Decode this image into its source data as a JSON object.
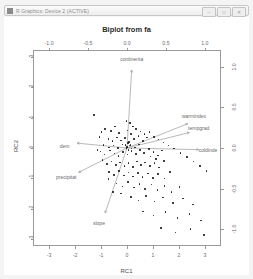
{
  "window": {
    "title": "R Graphics: Device 2 (ACTIVE)",
    "icon": "app-icon",
    "controls": [
      {
        "name": "minimize-button",
        "glyph": "–"
      },
      {
        "name": "maximize-button",
        "glyph": "□"
      },
      {
        "name": "close-button",
        "glyph": "✕"
      }
    ]
  },
  "chart_data": {
    "type": "scatter",
    "title": "Biplot from fa",
    "xlabel": "RC1",
    "ylabel": "RC2",
    "xlim": [
      -3.6,
      3.6
    ],
    "ylim": [
      -3.2,
      3.2
    ],
    "xticks": [
      "-3",
      "-2",
      "-1",
      "0",
      "1",
      "2",
      "3"
    ],
    "yticks": [
      "3",
      "2",
      "1",
      "0",
      "-1",
      "-2",
      "-3"
    ],
    "top_axis_label": "",
    "top_ticks": [
      "-1.0",
      "-0.5",
      "0.0",
      "0.5",
      "1.0"
    ],
    "right_axis_label": "",
    "right_ticks": [
      "1.0",
      "0.5",
      "0.0",
      "-0.5",
      "-1.0"
    ],
    "secondary_xlim": [
      -1.2,
      1.2
    ],
    "secondary_ylim": [
      -1.2,
      1.2
    ],
    "grid": false,
    "legend": "none",
    "loadings": [
      {
        "label": "continenta",
        "x": 0.06,
        "y": 0.96,
        "label_x": 0.06,
        "label_y": 1.1
      },
      {
        "label": "warmindex",
        "x": 0.78,
        "y": 0.3,
        "label_x": 0.86,
        "label_y": 0.4
      },
      {
        "label": "tempgrad",
        "x": 0.8,
        "y": 0.19,
        "label_x": 0.92,
        "label_y": 0.25
      },
      {
        "label": "coldinde",
        "x": 0.92,
        "y": -0.02,
        "label_x": 1.04,
        "label_y": -0.02
      },
      {
        "label": "dem",
        "x": -0.64,
        "y": 0.06,
        "label_x": -0.8,
        "label_y": 0.02
      },
      {
        "label": "precipitat",
        "x": -0.62,
        "y": -0.3,
        "label_x": -0.78,
        "label_y": -0.36
      },
      {
        "label": "slope",
        "x": -0.28,
        "y": -0.8,
        "label_x": -0.36,
        "label_y": -0.92
      }
    ],
    "points": [
      [
        -1.28,
        1.08
      ],
      [
        -0.84,
        0.62
      ],
      [
        -0.62,
        0.56
      ],
      [
        -0.46,
        0.7
      ],
      [
        -0.3,
        0.5
      ],
      [
        0.02,
        0.58
      ],
      [
        0.16,
        0.46
      ],
      [
        -0.72,
        0.3
      ],
      [
        -0.56,
        0.22
      ],
      [
        -0.38,
        0.34
      ],
      [
        -0.22,
        0.24
      ],
      [
        -0.08,
        0.32
      ],
      [
        0.08,
        0.2
      ],
      [
        0.26,
        0.3
      ],
      [
        0.44,
        0.4
      ],
      [
        -0.9,
        0.1
      ],
      [
        -0.7,
        0.02
      ],
      [
        -0.52,
        0.08
      ],
      [
        -0.34,
        0.0
      ],
      [
        -0.18,
        0.12
      ],
      [
        0.0,
        0.04
      ],
      [
        0.14,
        0.1
      ],
      [
        0.3,
        0.02
      ],
      [
        0.46,
        0.12
      ],
      [
        0.62,
        0.22
      ],
      [
        0.78,
        0.34
      ],
      [
        -1.02,
        -0.12
      ],
      [
        -0.86,
        -0.22
      ],
      [
        -0.66,
        -0.08
      ],
      [
        -0.48,
        -0.18
      ],
      [
        -0.32,
        -0.26
      ],
      [
        -0.16,
        -0.14
      ],
      [
        0.02,
        -0.22
      ],
      [
        0.18,
        -0.1
      ],
      [
        0.34,
        -0.2
      ],
      [
        0.5,
        -0.06
      ],
      [
        0.66,
        -0.16
      ],
      [
        0.84,
        -0.04
      ],
      [
        1.02,
        -0.14
      ],
      [
        1.2,
        -0.24
      ],
      [
        -0.94,
        -0.4
      ],
      [
        -0.78,
        -0.52
      ],
      [
        -0.6,
        -0.44
      ],
      [
        -0.42,
        -0.56
      ],
      [
        -0.26,
        -0.48
      ],
      [
        -0.1,
        -0.6
      ],
      [
        0.06,
        -0.5
      ],
      [
        0.22,
        -0.62
      ],
      [
        0.38,
        -0.44
      ],
      [
        0.54,
        -0.56
      ],
      [
        0.7,
        -0.48
      ],
      [
        0.88,
        -0.6
      ],
      [
        1.06,
        -0.5
      ],
      [
        1.24,
        -0.64
      ],
      [
        1.42,
        -0.42
      ],
      [
        -0.7,
        -0.78
      ],
      [
        -0.5,
        -0.88
      ],
      [
        -0.3,
        -0.76
      ],
      [
        -0.12,
        -0.9
      ],
      [
        0.06,
        -0.8
      ],
      [
        0.24,
        -0.94
      ],
      [
        0.42,
        -0.82
      ],
      [
        0.6,
        -0.96
      ],
      [
        0.8,
        -0.84
      ],
      [
        1.0,
        -0.98
      ],
      [
        1.2,
        -0.86
      ],
      [
        1.44,
        -1.0
      ],
      [
        1.66,
        -0.78
      ],
      [
        -0.4,
        -1.16
      ],
      [
        -0.18,
        -1.26
      ],
      [
        0.04,
        -1.12
      ],
      [
        0.26,
        -1.3
      ],
      [
        0.48,
        -1.18
      ],
      [
        0.7,
        -1.34
      ],
      [
        0.94,
        -1.2
      ],
      [
        1.18,
        -1.38
      ],
      [
        1.44,
        -1.24
      ],
      [
        1.72,
        -1.44
      ],
      [
        2.02,
        -1.28
      ],
      [
        0.16,
        -1.6
      ],
      [
        0.44,
        -1.72
      ],
      [
        0.74,
        -1.58
      ],
      [
        1.06,
        -1.76
      ],
      [
        1.38,
        -1.62
      ],
      [
        1.76,
        -1.8
      ],
      [
        2.16,
        -1.66
      ],
      [
        2.54,
        -1.86
      ],
      [
        0.62,
        -2.08
      ],
      [
        1.02,
        -2.22
      ],
      [
        1.48,
        -2.1
      ],
      [
        1.94,
        -2.3
      ],
      [
        2.4,
        -2.16
      ],
      [
        2.86,
        -2.38
      ],
      [
        1.3,
        -2.62
      ],
      [
        1.86,
        -2.78
      ],
      [
        2.44,
        -2.66
      ],
      [
        2.96,
        -2.86
      ],
      [
        -0.02,
        0.88
      ],
      [
        0.12,
        0.82
      ],
      [
        0.22,
        0.7
      ],
      [
        0.34,
        0.62
      ],
      [
        0.52,
        0.54
      ],
      [
        0.68,
        0.46
      ],
      [
        0.86,
        0.52
      ],
      [
        1.04,
        0.36
      ],
      [
        1.22,
        0.28
      ],
      [
        1.4,
        0.18
      ],
      [
        1.6,
        0.08
      ],
      [
        1.82,
        -0.02
      ],
      [
        2.06,
        -0.16
      ],
      [
        2.3,
        -0.3
      ],
      [
        2.56,
        -0.44
      ],
      [
        2.82,
        -0.6
      ],
      [
        3.06,
        -0.76
      ],
      [
        0.04,
        0.16
      ],
      [
        0.1,
        0.08
      ],
      [
        0.18,
        -0.02
      ],
      [
        0.06,
        -0.06
      ],
      [
        -0.02,
        0.0
      ],
      [
        -0.06,
        0.1
      ],
      [
        -0.72,
        -1.02
      ],
      [
        -0.54,
        -1.44
      ],
      [
        -0.22,
        -1.5
      ],
      [
        0.9,
        -0.28
      ],
      [
        1.12,
        -0.36
      ],
      [
        1.34,
        -0.08
      ],
      [
        -1.06,
        0.36
      ],
      [
        -1.14,
        -0.06
      ],
      [
        -0.98,
        0.52
      ]
    ]
  }
}
